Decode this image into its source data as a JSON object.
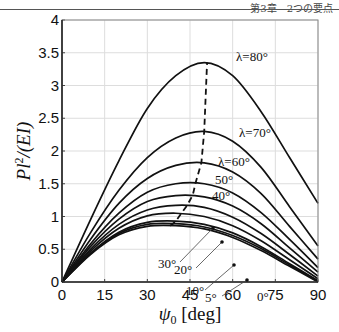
{
  "header": {
    "text": "第3章　2つの要点"
  },
  "chart_data": {
    "type": "line",
    "title": "",
    "xlabel": "ψ0 [deg]",
    "ylabel": "Pl²/(EI)",
    "xlim": [
      0,
      90
    ],
    "ylim": [
      0,
      4
    ],
    "xticks": [
      0,
      15,
      30,
      45,
      60,
      75,
      90
    ],
    "yticks": [
      0,
      0.5,
      1,
      1.5,
      2,
      2.5,
      3,
      3.5,
      4
    ],
    "ytick_labels": [
      "0",
      "0.5",
      "1",
      "1.5",
      "2",
      "2.5",
      "3",
      "3.5",
      "4"
    ],
    "grid": true,
    "legend": "inline labels",
    "x": [
      0,
      10,
      20,
      30,
      40,
      50,
      60,
      70,
      80,
      90
    ],
    "series": [
      {
        "name": "λ=80°",
        "peak_x": 51,
        "peak_y": 3.35,
        "end_y": 1.2,
        "values": [
          0,
          0.95,
          1.85,
          2.65,
          3.15,
          3.35,
          3.15,
          2.6,
          1.9,
          1.2
        ]
      },
      {
        "name": "λ=70°",
        "peak_x": 50,
        "peak_y": 2.3,
        "end_y": 0.55,
        "values": [
          0,
          0.75,
          1.4,
          1.9,
          2.2,
          2.3,
          2.15,
          1.75,
          1.15,
          0.55
        ]
      },
      {
        "name": "λ=60°",
        "peak_x": 49,
        "peak_y": 1.82,
        "end_y": 0.35,
        "values": [
          0,
          0.65,
          1.2,
          1.58,
          1.78,
          1.82,
          1.68,
          1.35,
          0.85,
          0.35
        ]
      },
      {
        "name": "50°",
        "peak_x": 47,
        "peak_y": 1.52,
        "end_y": 0.22,
        "values": [
          0,
          0.58,
          1.05,
          1.37,
          1.5,
          1.5,
          1.36,
          1.06,
          0.65,
          0.22
        ]
      },
      {
        "name": "40°",
        "peak_x": 46,
        "peak_y": 1.33,
        "end_y": 0.15,
        "values": [
          0,
          0.54,
          0.96,
          1.23,
          1.32,
          1.3,
          1.16,
          0.89,
          0.52,
          0.15
        ]
      },
      {
        "name": "30°",
        "peak_x": 44,
        "peak_y": 1.17,
        "end_y": 0.09,
        "values": [
          0,
          0.5,
          0.88,
          1.1,
          1.17,
          1.14,
          0.99,
          0.74,
          0.42,
          0.09
        ]
      },
      {
        "name": "20°",
        "peak_x": 42,
        "peak_y": 1.05,
        "end_y": 0.05,
        "values": [
          0,
          0.47,
          0.82,
          1.01,
          1.05,
          1.0,
          0.86,
          0.63,
          0.34,
          0.05
        ]
      },
      {
        "name": "10°",
        "peak_x": 40,
        "peak_y": 0.93,
        "end_y": 0.02,
        "values": [
          0,
          0.44,
          0.76,
          0.91,
          0.93,
          0.88,
          0.75,
          0.54,
          0.28,
          0.02
        ]
      },
      {
        "name": "5°",
        "peak_x": 39,
        "peak_y": 0.89,
        "end_y": 0.01,
        "values": [
          0,
          0.43,
          0.74,
          0.88,
          0.89,
          0.84,
          0.71,
          0.51,
          0.26,
          0.01
        ]
      },
      {
        "name": "0°",
        "peak_x": 38,
        "peak_y": 0.86,
        "end_y": 0.0,
        "values": [
          0,
          0.42,
          0.72,
          0.85,
          0.86,
          0.81,
          0.68,
          0.48,
          0.24,
          0.0
        ]
      }
    ],
    "annotations": [
      "λ=80°",
      "λ=70°",
      "λ=60°",
      "50°",
      "40°",
      "30°",
      "20°",
      "10°",
      "5°",
      "0°"
    ],
    "dashed_line": "locus of maxima (dashed)"
  }
}
